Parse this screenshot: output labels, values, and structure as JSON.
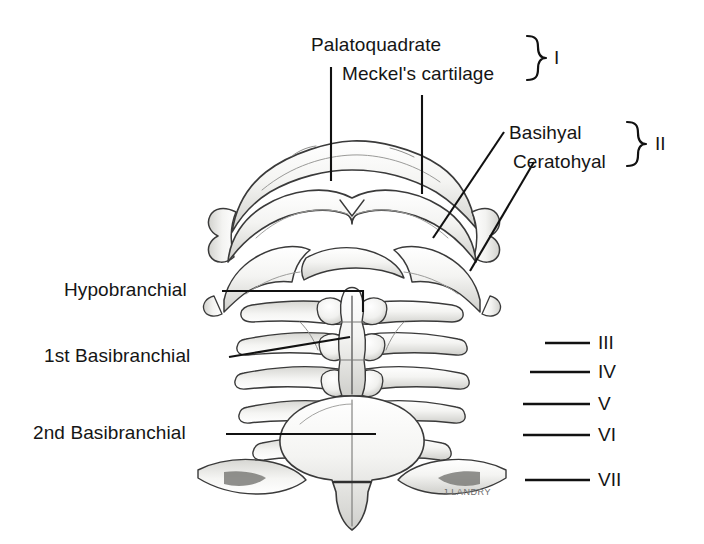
{
  "figure": {
    "kind": "anatomical-line-drawing",
    "background_color": "#ffffff",
    "ink_color": "#151515",
    "cartilage_fill": "#f2f2f0",
    "cartilage_shade": "#c9c9c6",
    "signature": "J LANDRY"
  },
  "labels": {
    "palatoquadrate": "Palatoquadrate",
    "meckels_cartilage": "Meckel's cartilage",
    "basihyal": "Basihyal",
    "ceratohyal": "Ceratohyal",
    "hypobranchial": "Hypobranchial",
    "first_basibranchial": "1st Basibranchial",
    "second_basibranchial": "2nd Basibranchial"
  },
  "braces": [
    {
      "id": "arch-1",
      "numeral": "I",
      "covers": [
        "Palatoquadrate",
        "Meckel's cartilage"
      ]
    },
    {
      "id": "arch-2",
      "numeral": "II",
      "covers": [
        "Basihyal",
        "Ceratohyal"
      ]
    }
  ],
  "arch_numerals": [
    {
      "numeral": "III"
    },
    {
      "numeral": "IV"
    },
    {
      "numeral": "V"
    },
    {
      "numeral": "VI"
    },
    {
      "numeral": "VII"
    }
  ]
}
